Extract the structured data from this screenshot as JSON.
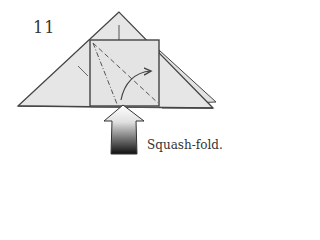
{
  "diagram": {
    "step_number": "11",
    "instruction": "Squash-fold.",
    "colors": {
      "paper": "#e6e6e6",
      "outline": "#444444",
      "arrow_top": "#ffffff",
      "arrow_bottom": "#111111"
    },
    "elements": [
      "triangle-base",
      "square-flap",
      "valley-fold-line",
      "mountain-fold-line",
      "curved-fold-arrow",
      "push-arrow"
    ]
  }
}
